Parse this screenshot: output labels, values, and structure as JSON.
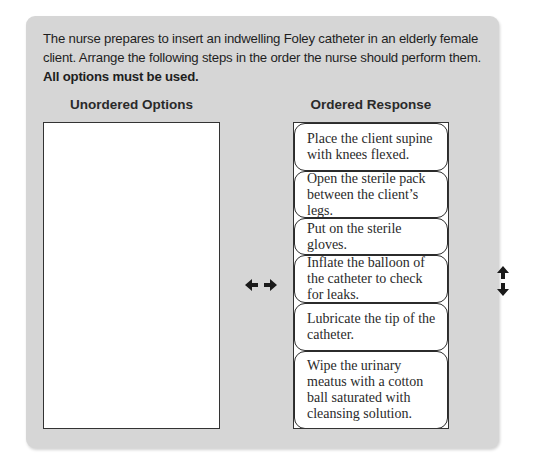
{
  "question": {
    "text": "The nurse prepares to insert an indwelling Foley catheter in an elderly female client. Arrange the following steps in the order the nurse should perform them.",
    "instruction": "All options must be used."
  },
  "unordered": {
    "heading": "Unordered Options",
    "items": []
  },
  "ordered": {
    "heading": "Ordered Response",
    "items": [
      {
        "label": "Place the client supine with knees flexed."
      },
      {
        "label": "Open the sterile pack between the client’s legs."
      },
      {
        "label": "Put on the sterile gloves."
      },
      {
        "label": "Inflate the balloon of the catheter to check for leaks."
      },
      {
        "label": "Lubricate the tip of the catheter."
      },
      {
        "label": "Wipe the urinary meatus with a cotton ball saturated with cleansing solution."
      }
    ]
  },
  "icons": {
    "move_between_lists": "left-right-arrow-icon",
    "reorder": "up-down-arrow-icon"
  },
  "colors": {
    "panel_background": "#d6d6d6",
    "box_background": "#ffffff",
    "border": "#2b2b2b"
  }
}
